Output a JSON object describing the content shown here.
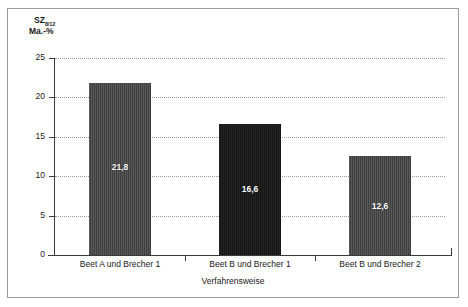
{
  "chart_data": {
    "type": "bar",
    "title": "",
    "categories": [
      "Beet A und Brecher 1",
      "Beet B und Brecher 1",
      "Beet B und Brecher 2"
    ],
    "values": [
      21.8,
      16.6,
      12.6
    ],
    "value_labels": [
      "21,8",
      "16,6",
      "12,6"
    ],
    "xlabel": "Verfahrensweise",
    "ylabel": "SZ",
    "ylabel_subscript": "8/12",
    "yunit": "Ma.-%",
    "ylim": [
      0,
      25
    ],
    "ytick_labels": [
      "25",
      "20",
      "15",
      "10",
      "5",
      "0"
    ],
    "ytick_values": [
      25,
      20,
      15,
      10,
      5,
      0
    ],
    "grid": true,
    "legend": "none",
    "bar_colors": [
      "#3f3f3f",
      "#161616",
      "#3f3f3f"
    ]
  }
}
